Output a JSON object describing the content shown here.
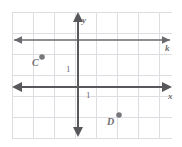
{
  "figure": {
    "type": "coordinate-plane",
    "width": 182,
    "height": 147,
    "background_color": "#ffffff",
    "grid": {
      "color": "#dedee2",
      "spacing_px": 21,
      "left": 12,
      "top": 12,
      "right": 172,
      "bottom": 138,
      "visible": true
    },
    "axis_color": "#58585c",
    "label_color": "#6e6e72",
    "point_color": "#78787c"
  },
  "axes": {
    "x": {
      "name": "x",
      "label": "x",
      "label_x": 168,
      "label_y": 92,
      "y_px": 87,
      "x_start": 14,
      "x_end": 170,
      "arrows": "both"
    },
    "y": {
      "name": "y",
      "label": "y",
      "label_x": 82,
      "label_y": 16,
      "x_px": 78,
      "y_start": 14,
      "y_end": 135,
      "arrows": "both"
    }
  },
  "line_k": {
    "label": "k",
    "label_x": 165,
    "label_y": 44,
    "y_px": 40,
    "x_start": 14,
    "x_end": 170,
    "arrows": "both",
    "description": "horizontal line parallel to the x-axis, 2 units above it"
  },
  "ticks": [
    {
      "label": "1",
      "axis": "y",
      "x": 66,
      "y": 65,
      "unit_value": 1
    },
    {
      "label": "1",
      "axis": "x",
      "x": 86,
      "y": 91,
      "unit_value": 1
    }
  ],
  "points": [
    {
      "label": "C",
      "dot_x": 42,
      "dot_y": 57,
      "label_x": 32,
      "label_y": 58,
      "coordinates": [
        -2,
        1.5
      ]
    },
    {
      "label": "D",
      "dot_x": 119,
      "dot_y": 115,
      "label_x": 107,
      "label_y": 117,
      "coordinates": [
        2,
        -1.5
      ]
    }
  ],
  "chart_data": {
    "type": "scatter",
    "title": "",
    "xlabel": "x",
    "ylabel": "y",
    "xlim": [
      -3.2,
      4.5
    ],
    "ylim": [
      -3.5,
      3.5
    ],
    "grid": true,
    "legend": "none",
    "unit_tick_labels": [
      "1",
      "1"
    ],
    "points": [
      {
        "name": "C",
        "x": -2,
        "y": 1.5
      },
      {
        "name": "D",
        "x": 2,
        "y": -1.5
      }
    ],
    "lines": [
      {
        "name": "k",
        "type": "horizontal",
        "y": 2,
        "label": "k"
      }
    ],
    "annotations": [
      "C",
      "D",
      "k",
      "x",
      "y",
      "1",
      "1"
    ]
  }
}
